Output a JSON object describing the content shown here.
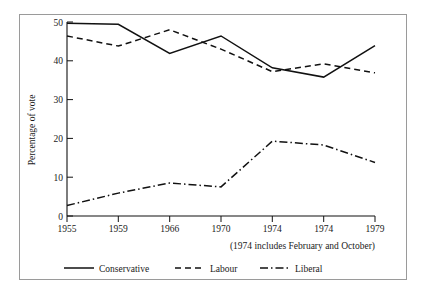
{
  "chart_data": {
    "type": "line",
    "title": "",
    "subtitle": "",
    "xlabel": "",
    "ylabel": "Percentage of vote",
    "categories": [
      "1955",
      "1959",
      "1966",
      "1970",
      "1974",
      "1974",
      "1979"
    ],
    "ylim": [
      0,
      50
    ],
    "xlim": [
      0,
      6
    ],
    "yticks": [
      "0",
      "10",
      "20",
      "30",
      "40",
      "50"
    ],
    "ytick_values": [
      0,
      10,
      20,
      30,
      40,
      50
    ],
    "grid": false,
    "legend_position": "bottom",
    "annotation": "(1974 includes February and October)",
    "series": [
      {
        "name": "Conservative",
        "style": "solid",
        "color": "#111111",
        "values": [
          49.7,
          49.4,
          41.9,
          46.4,
          38.2,
          35.8,
          43.9
        ]
      },
      {
        "name": "Labour",
        "style": "dashed",
        "color": "#111111",
        "values": [
          46.4,
          43.8,
          48.0,
          43.0,
          37.2,
          39.2,
          36.9
        ]
      },
      {
        "name": "Liberal",
        "style": "dash-dot",
        "color": "#111111",
        "values": [
          2.7,
          5.9,
          8.5,
          7.5,
          19.3,
          18.3,
          13.8
        ]
      }
    ]
  },
  "legend": {
    "items": [
      {
        "label": "Conservative"
      },
      {
        "label": "Labour"
      },
      {
        "label": "Liberal"
      }
    ]
  },
  "caption": {
    "note": "(1974 includes February and October)"
  },
  "axes": {
    "y_title": "Percentage of vote",
    "y_tick_0": "0",
    "y_tick_1": "10",
    "y_tick_2": "20",
    "y_tick_3": "30",
    "y_tick_4": "40",
    "y_tick_5": "50",
    "x_tick_0": "1955",
    "x_tick_1": "1959",
    "x_tick_2": "1966",
    "x_tick_3": "1970",
    "x_tick_4": "1974",
    "x_tick_5": "1974",
    "x_tick_6": "1979"
  },
  "colors": {
    "ink": "#111111",
    "frame": "#9a9a9a",
    "background": "#ffffff"
  }
}
